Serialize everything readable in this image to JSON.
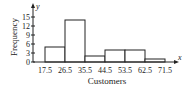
{
  "chart_data": {
    "type": "bar",
    "title": "",
    "xlabel": "Customers",
    "ylabel": "Frequency",
    "x_axis_symbol": "x",
    "y_axis_symbol": "y",
    "categories": [
      "17.5-26.5",
      "26.5-35.5",
      "35.5-44.5",
      "44.5-53.5",
      "53.5-62.5",
      "62.5-71.5"
    ],
    "bin_edges": [
      17.5,
      26.5,
      35.5,
      44.5,
      53.5,
      62.5,
      71.5
    ],
    "values": [
      5,
      14,
      2,
      4,
      4,
      1
    ],
    "yticks": [
      0,
      3,
      6,
      9,
      12,
      15
    ],
    "xticks": [
      "17.5",
      "26.5",
      "35.5",
      "44.5",
      "53.5",
      "62.5",
      "71.5"
    ],
    "ylim": [
      0,
      16
    ],
    "grid": false,
    "legend": null
  }
}
